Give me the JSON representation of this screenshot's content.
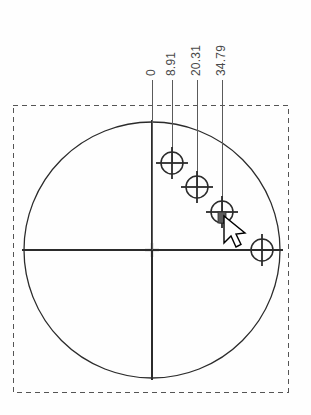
{
  "drawing": {
    "title": "Hole Pattern Dimension View",
    "background_color": "#fefefe",
    "line_color": "#2b2b2b",
    "construction_color": "#5a5a5a",
    "dashed_border_color": "#555555",
    "text_color": "#4a4a4a",
    "cursor_fill": "#ffffff",
    "cursor_stroke": "#000000",
    "handle_color": "#5c5c5c"
  },
  "boundary": {
    "name": "sheet-boundary",
    "style": "dashed",
    "x": 13,
    "y": 105,
    "width": 275,
    "height": 287
  },
  "part": {
    "outline_name": "circular-part-outline",
    "shape": "circle",
    "center_x": 152,
    "center_y": 250,
    "radius": 128
  },
  "centerlines": {
    "horizontal": {
      "x1": 22,
      "y1": 250,
      "x2": 283,
      "y2": 250
    },
    "vertical": {
      "x1": 152,
      "y1": 120,
      "x2": 152,
      "y2": 380
    },
    "center_mark": {
      "x": 152,
      "y": 250,
      "size": 7
    }
  },
  "dimensions": [
    {
      "label": "0",
      "value": 0,
      "leader_x": 152,
      "leader_top_y": 80,
      "leader_bottom_y": 250,
      "label_x": 152,
      "label_baseline_y": 76
    },
    {
      "label": "8.91",
      "value": 8.91,
      "leader_x": 172,
      "leader_top_y": 80,
      "leader_bottom_y": 163,
      "label_x": 172,
      "label_baseline_y": 76
    },
    {
      "label": "20.31",
      "value": 20.31,
      "leader_x": 197,
      "leader_top_y": 80,
      "leader_bottom_y": 187,
      "label_x": 197,
      "label_baseline_y": 76
    },
    {
      "label": "34.79",
      "value": 34.79,
      "leader_x": 222,
      "leader_top_y": 80,
      "leader_bottom_y": 212,
      "label_x": 222,
      "label_baseline_y": 76
    }
  ],
  "hole_markers": [
    {
      "id": "hole-1",
      "cx": 172,
      "cy": 163,
      "r": 11,
      "cross_extent": 16,
      "selected": false
    },
    {
      "id": "hole-2",
      "cx": 197,
      "cy": 187,
      "r": 11,
      "cross_extent": 16,
      "selected": false
    },
    {
      "id": "hole-3",
      "cx": 222,
      "cy": 212,
      "r": 11,
      "cross_extent": 16,
      "selected": true
    },
    {
      "id": "hole-4",
      "cx": 262,
      "cy": 250,
      "r": 11,
      "cross_extent": 16,
      "selected": false
    }
  ],
  "selection_handle": {
    "name": "selection-handle",
    "x": 218,
    "y": 212,
    "width": 8,
    "height": 11
  },
  "cursor": {
    "name": "mouse-cursor",
    "tip_x": 224,
    "tip_y": 216,
    "type": "arrow-pointer"
  }
}
